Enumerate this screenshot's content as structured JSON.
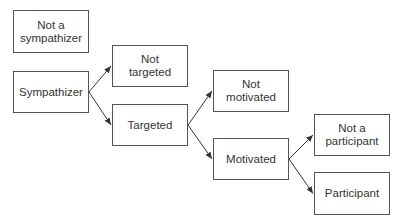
{
  "nodes": [
    {
      "id": "not_sympathizer",
      "label": "Not a\nsympathizer",
      "x": 13,
      "y": 10,
      "w": 76,
      "h": 43
    },
    {
      "id": "sympathizer",
      "label": "Sympathizer",
      "x": 13,
      "y": 71,
      "w": 76,
      "h": 42
    },
    {
      "id": "not_targeted",
      "label": "Not\ntargeted",
      "x": 112,
      "y": 45,
      "w": 76,
      "h": 42
    },
    {
      "id": "targeted",
      "label": "Targeted",
      "x": 112,
      "y": 104,
      "w": 76,
      "h": 42
    },
    {
      "id": "not_motivated",
      "label": "Not\nmotivated",
      "x": 213,
      "y": 70,
      "w": 76,
      "h": 42
    },
    {
      "id": "motivated",
      "label": "Motivated",
      "x": 213,
      "y": 138,
      "w": 76,
      "h": 42
    },
    {
      "id": "not_participant",
      "label": "Not a\nparticipant",
      "x": 314,
      "y": 114,
      "w": 76,
      "h": 42
    },
    {
      "id": "participant",
      "label": "Participant",
      "x": 314,
      "y": 172,
      "w": 76,
      "h": 43
    }
  ],
  "edges": [
    {
      "from": "sympathizer",
      "to": "not_targeted"
    },
    {
      "from": "sympathizer",
      "to": "targeted"
    },
    {
      "from": "targeted",
      "to": "not_motivated"
    },
    {
      "from": "targeted",
      "to": "motivated"
    },
    {
      "from": "motivated",
      "to": "not_participant"
    },
    {
      "from": "motivated",
      "to": "participant"
    }
  ],
  "colors": {
    "border": "#555555",
    "text": "#333333",
    "arrow": "#333333"
  }
}
